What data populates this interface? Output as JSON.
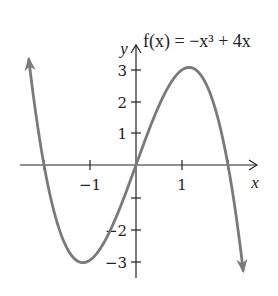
{
  "chart_data": {
    "type": "line",
    "title": "f(x) = −x³ + 4x",
    "xlabel": "x",
    "ylabel": "y",
    "xlim": [
      -2.5,
      2.6
    ],
    "ylim": [
      -3.5,
      3.8
    ],
    "x_ticks": [
      -2,
      -1,
      1,
      2
    ],
    "x_tick_labels": [
      "−1",
      "1"
    ],
    "y_ticks": [
      -3,
      -2,
      -1,
      1,
      2,
      3
    ],
    "y_tick_labels": [
      "−3",
      "−2",
      "1",
      "2",
      "3"
    ],
    "grid": false,
    "series": [
      {
        "name": "f(x) = −x³ + 4x",
        "function": "-x^3 + 4x",
        "x_range": [
          -2.33,
          2.33
        ],
        "arrows_at_ends": true,
        "color": "#7a7a7a",
        "key_points": [
          {
            "x": -2,
            "y": 0,
            "label": "x-intercept"
          },
          {
            "x": 0,
            "y": 0,
            "label": "x-intercept"
          },
          {
            "x": 2,
            "y": 0,
            "label": "x-intercept"
          },
          {
            "x": -1.155,
            "y": -3.08,
            "label": "local minimum"
          },
          {
            "x": 1.155,
            "y": 3.08,
            "label": "local maximum"
          }
        ]
      }
    ]
  },
  "labels": {
    "title": "f(x) = −x³ + 4x",
    "x_axis": "x",
    "y_axis": "y",
    "x_tick_neg1": "−1",
    "x_tick_1": "1",
    "y_tick_3": "3",
    "y_tick_2": "2",
    "y_tick_1": "1",
    "y_tick_neg2": "−2",
    "y_tick_neg3": "−3"
  },
  "colors": {
    "curve": "#7a7a7a",
    "axes": "#222222"
  }
}
